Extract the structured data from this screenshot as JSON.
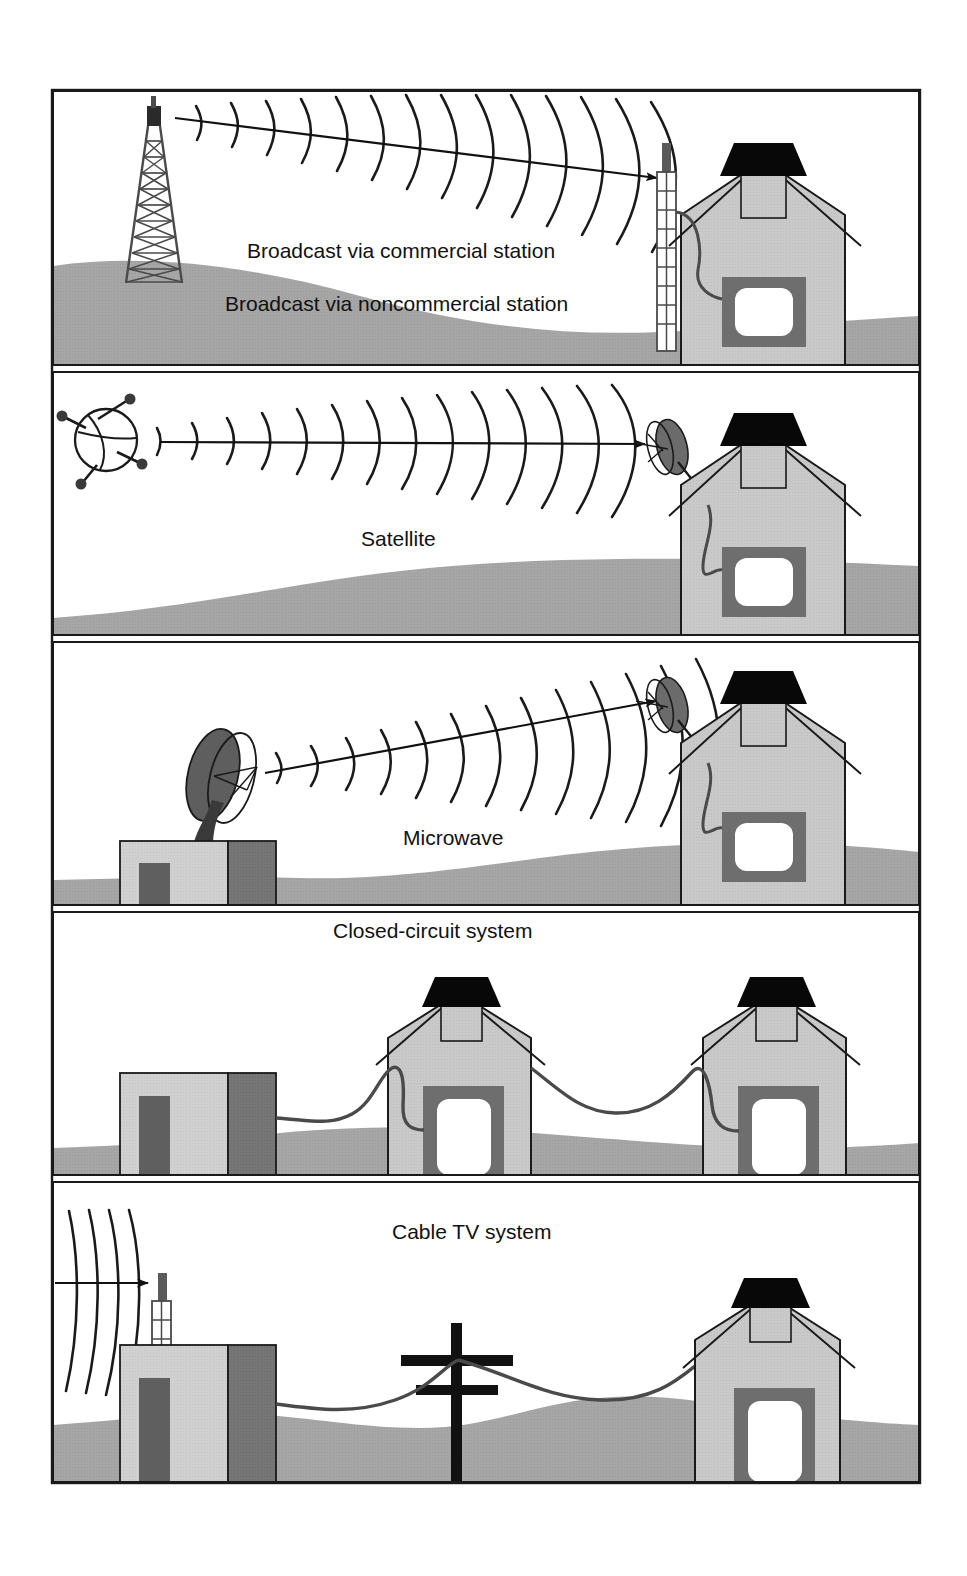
{
  "figure": {
    "frame": {
      "stroke": "#1a1a1a",
      "x": 52,
      "y": 90,
      "width": 868,
      "height": 1393
    },
    "colors": {
      "ink": "#1a1a1a",
      "ground": "#a6a6a6",
      "house_body": "#c8c8c8",
      "house_dark": "#6e6e6e",
      "roof_black": "#080808",
      "station_light": "#cfcfcf",
      "station_dark": "#6e6e6e",
      "dish_dark": "#5a5a5a",
      "tv_frame": "#6e6e6e",
      "tv_screen": "#ffffff",
      "background": "#ffffff",
      "cable": "#4a4a4a"
    },
    "panels": [
      {
        "id": "panel-broadcast",
        "index": 1,
        "labels": [
          {
            "text": "Broadcast via commercial station",
            "x": 247,
            "y": 258
          },
          {
            "text": "Broadcast via noncommercial station",
            "x": 225,
            "y": 311
          }
        ],
        "source_icon": "transmission-tower",
        "receiver_icon": "roof-antenna-mast",
        "wave_count": 14,
        "has_arrow": true
      },
      {
        "id": "panel-satellite",
        "index": 2,
        "labels": [
          {
            "text": "Satellite",
            "x": 361,
            "y": 546
          }
        ],
        "source_icon": "satellite",
        "receiver_icon": "satellite-dish",
        "wave_count": 14,
        "has_arrow": true
      },
      {
        "id": "panel-microwave",
        "index": 3,
        "labels": [
          {
            "text": "Microwave",
            "x": 403,
            "y": 845
          }
        ],
        "source_icon": "microwave-dish-on-station",
        "receiver_icon": "satellite-dish",
        "wave_count": 13,
        "has_arrow": true
      },
      {
        "id": "panel-closed-circuit",
        "index": 4,
        "labels": [
          {
            "text": "Closed-circuit system",
            "x": 333,
            "y": 938
          }
        ],
        "source_icon": "station-building",
        "receiver_icon": "two-houses-cabled",
        "wave_count": 0,
        "has_arrow": false
      },
      {
        "id": "panel-cable-tv",
        "index": 5,
        "labels": [
          {
            "text": "Cable TV system",
            "x": 392,
            "y": 1239
          }
        ],
        "source_icon": "station-with-antenna",
        "receiver_icon": "house-with-utility-pole",
        "wave_count": 4,
        "has_arrow": true
      }
    ]
  }
}
